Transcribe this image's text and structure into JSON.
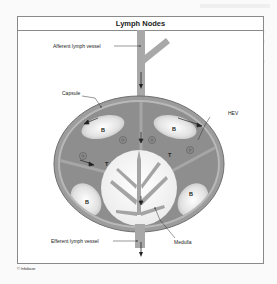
{
  "figure": {
    "title": "Lymph Nodes",
    "credit": "© Infobase"
  },
  "labels": {
    "afferent": "Afferent lymph vessel",
    "capsule": "Capsule",
    "hev": "HEV",
    "efferent": "Efferent lymph vessel",
    "medulla": "Medulla",
    "b_follicle": "B",
    "t_zone": "T"
  },
  "colors": {
    "capsule": "#9a9a9a",
    "cortex": "#8e8e8e",
    "follicle": "#e6e6e6",
    "medulla": "#f2f2f2",
    "vessel": "#a8a8a8",
    "line": "#333333"
  }
}
